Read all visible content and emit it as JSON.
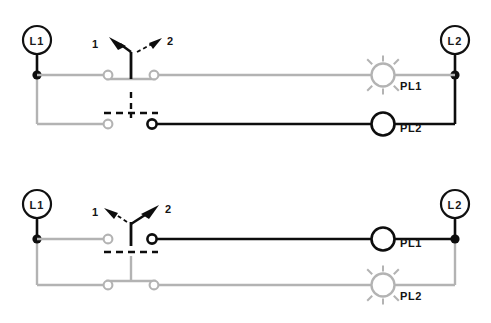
{
  "colors": {
    "energized": "#0d0d0d",
    "deenergized": "#b3b3b3",
    "background": "#ffffff",
    "label_text": "#141414"
  },
  "diagrams": [
    {
      "id": "diagram-top",
      "state_description": "Selector switch in position 1",
      "left_terminal": {
        "label": "L1",
        "name": "l1-terminal"
      },
      "right_terminal": {
        "label": "L2",
        "name": "l2-terminal"
      },
      "switch": {
        "name": "selector-switch",
        "selected_position": "1",
        "positions": [
          {
            "label": "1",
            "arrow": "solid",
            "direction": "up-left"
          },
          {
            "label": "2",
            "arrow": "dashed",
            "direction": "up-right"
          }
        ]
      },
      "rungs": [
        {
          "name": "rung-pl1",
          "lamp_label": "PL1",
          "lamp_state": "lit",
          "contact_state": "closed",
          "energized": false
        },
        {
          "name": "rung-pl2",
          "lamp_label": "PL2",
          "lamp_state": "unlit",
          "contact_state": "open",
          "energized": true
        }
      ]
    },
    {
      "id": "diagram-bottom",
      "state_description": "Selector switch in position 2",
      "left_terminal": {
        "label": "L1",
        "name": "l1-terminal"
      },
      "right_terminal": {
        "label": "L2",
        "name": "l2-terminal"
      },
      "switch": {
        "name": "selector-switch",
        "selected_position": "2",
        "positions": [
          {
            "label": "1",
            "arrow": "dashed",
            "direction": "up-left"
          },
          {
            "label": "2",
            "arrow": "solid",
            "direction": "up-right"
          }
        ]
      },
      "rungs": [
        {
          "name": "rung-pl1",
          "lamp_label": "PL1",
          "lamp_state": "unlit",
          "contact_state": "open",
          "energized": true
        },
        {
          "name": "rung-pl2",
          "lamp_label": "PL2",
          "lamp_state": "lit",
          "contact_state": "closed",
          "energized": false
        }
      ]
    }
  ]
}
